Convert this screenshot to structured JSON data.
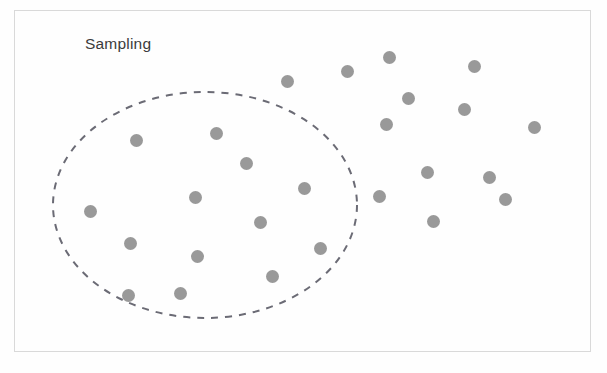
{
  "figure": {
    "width": 607,
    "height": 373,
    "background_color": "#fefefe",
    "frame": {
      "x": 14,
      "y": 10,
      "width": 577,
      "height": 342,
      "border_color": "#d9d9d9",
      "border_width": 1
    }
  },
  "annotations": {
    "sampling_label": "Sampling",
    "sampling_label_color": "#3b3b3b"
  },
  "chart_data": {
    "type": "scatter",
    "title": "",
    "xlabel": "",
    "ylabel": "",
    "grid": false,
    "legend": "none",
    "annotations": [
      {
        "text": "Sampling",
        "x": 85,
        "y": 46,
        "describes": "dashed-ellipse-region"
      }
    ],
    "regions": [
      {
        "name": "sampling-region",
        "shape": "ellipse",
        "cx": 205,
        "cy": 205,
        "rx": 152,
        "ry": 113,
        "stroke": "#6b6b75",
        "stroke_dasharray": "7 7",
        "stroke_width": 2,
        "fill": "none"
      }
    ],
    "series": [
      {
        "name": "points-inside-sampling-region",
        "marker": "circle",
        "color": "#909090",
        "marker_size": 13,
        "count": 13,
        "points": [
          {
            "x": 136,
            "y": 140
          },
          {
            "x": 216,
            "y": 133
          },
          {
            "x": 246,
            "y": 163
          },
          {
            "x": 90,
            "y": 211
          },
          {
            "x": 195,
            "y": 197
          },
          {
            "x": 304,
            "y": 188
          },
          {
            "x": 260,
            "y": 222
          },
          {
            "x": 130,
            "y": 243
          },
          {
            "x": 320,
            "y": 248
          },
          {
            "x": 197,
            "y": 256
          },
          {
            "x": 272,
            "y": 276
          },
          {
            "x": 128,
            "y": 295
          },
          {
            "x": 180,
            "y": 293
          }
        ]
      },
      {
        "name": "points-outside-sampling-region",
        "marker": "circle",
        "color": "#909090",
        "marker_size": 13,
        "count": 14,
        "points": [
          {
            "x": 389,
            "y": 57
          },
          {
            "x": 347,
            "y": 71
          },
          {
            "x": 287,
            "y": 81
          },
          {
            "x": 474,
            "y": 66
          },
          {
            "x": 408,
            "y": 98
          },
          {
            "x": 464,
            "y": 109
          },
          {
            "x": 386,
            "y": 124
          },
          {
            "x": 534,
            "y": 127
          },
          {
            "x": 427,
            "y": 172
          },
          {
            "x": 489,
            "y": 177
          },
          {
            "x": 379,
            "y": 196
          },
          {
            "x": 505,
            "y": 199
          },
          {
            "x": 433,
            "y": 221
          }
        ]
      }
    ]
  }
}
